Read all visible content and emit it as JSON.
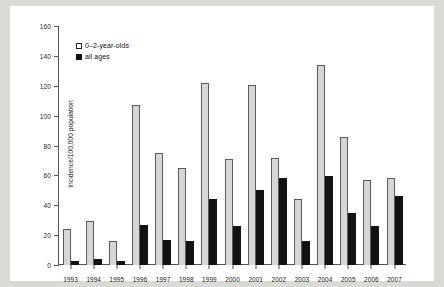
{
  "chart_data": {
    "type": "bar",
    "title": "",
    "xlabel": "",
    "ylabel": "Incidence/100,000 population",
    "ylim": [
      0,
      160
    ],
    "yticks": [
      0,
      20,
      40,
      60,
      80,
      100,
      120,
      140,
      160
    ],
    "grid": false,
    "legend_position": "top-left",
    "categories": [
      "1993",
      "1994",
      "1995",
      "1996",
      "1997",
      "1998",
      "1999",
      "2000",
      "2001",
      "2002",
      "2003",
      "2004",
      "2005",
      "2006",
      "2007"
    ],
    "series": [
      {
        "name": "0–2-year-olds",
        "color": "#d6d6d6",
        "values": [
          24,
          29.5,
          16,
          107,
          75,
          65,
          122,
          71,
          120.5,
          71.5,
          44,
          134,
          86,
          57,
          58
        ]
      },
      {
        "name": "all ages",
        "color": "#121212",
        "values": [
          3,
          4,
          3,
          27,
          17,
          16,
          44,
          26,
          50,
          58,
          16,
          59.5,
          35,
          26,
          46
        ]
      }
    ]
  },
  "legend": {
    "items": [
      {
        "label": "0–2-year-olds",
        "swatch": "open-square"
      },
      {
        "label": "all ages",
        "swatch": "filled-square"
      }
    ]
  }
}
